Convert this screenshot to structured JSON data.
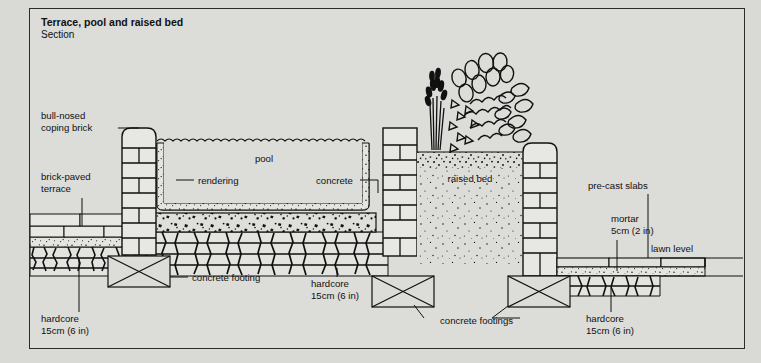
{
  "title": "Terrace, pool and raised bed",
  "subtitle": "Section",
  "colors": {
    "paper": "#dcdcd8",
    "page": "#d9d9d6",
    "ink": "#111111",
    "brick_fill": "#e7e7e3",
    "stone_fill": "#e3e3df",
    "water_fill": "#dcdcd8"
  },
  "labels": {
    "coping": "bull-nosed\ncoping brick",
    "coping_l1": "bull-nosed",
    "coping_l2": "coping brick",
    "terrace_l1": "brick-paved",
    "terrace_l2": "terrace",
    "hardcore_left_l1": "hardcore",
    "hardcore_left_l2": "15cm (6 in)",
    "concrete_footing": "concrete footing",
    "rendering": "rendering",
    "pool": "pool",
    "concrete": "concrete",
    "raised_bed": "raised bed",
    "hardcore_mid_l1": "hardcore",
    "hardcore_mid_l2": "15cm (6 in)",
    "concrete_footings": "concrete footings",
    "precast_slabs": "pre-cast slabs",
    "mortar_l1": "mortar",
    "mortar_l2": "5cm (2 in)",
    "lawn_level": "lawn level",
    "hardcore_right_l1": "hardcore",
    "hardcore_right_l2": "15cm (6 in)"
  },
  "icons": {
    "footing_box": "concrete-footing-box-icon",
    "plant_grass": "ornamental-grass-icon",
    "plant_shrub": "shrub-icon",
    "water_line": "water-surface-icon"
  }
}
